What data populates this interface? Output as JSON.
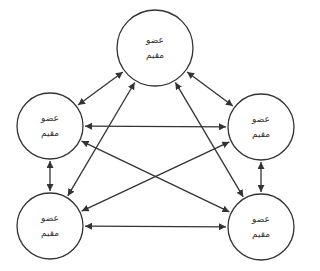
{
  "diagram": {
    "type": "fully-connected network",
    "stroke_color": "#333333",
    "background": "#ffffff",
    "nodes": [
      {
        "id": "top",
        "cx": 155,
        "cy": 48,
        "r": 38,
        "line1": "عضو",
        "line2": "مقيم"
      },
      {
        "id": "left-mid",
        "cx": 50,
        "cy": 126,
        "r": 33,
        "line1": "عضو",
        "line2": "مقيم"
      },
      {
        "id": "right-mid",
        "cx": 261,
        "cy": 127,
        "r": 33,
        "line1": "عضو",
        "line2": "مقيم"
      },
      {
        "id": "left-bottom",
        "cx": 50,
        "cy": 226,
        "r": 33,
        "line1": "عضو",
        "line2": "مقيم"
      },
      {
        "id": "right-bottom",
        "cx": 261,
        "cy": 227,
        "r": 33,
        "line1": "عضو",
        "line2": "مقيم"
      }
    ],
    "edges": [
      {
        "from": "top",
        "to": "left-mid",
        "bidirectional": true
      },
      {
        "from": "top",
        "to": "right-mid",
        "bidirectional": true
      },
      {
        "from": "left-mid",
        "to": "right-mid",
        "bidirectional": true
      },
      {
        "from": "left-mid",
        "to": "left-bottom",
        "bidirectional": true
      },
      {
        "from": "right-mid",
        "to": "right-bottom",
        "bidirectional": true
      },
      {
        "from": "left-bottom",
        "to": "right-bottom",
        "bidirectional": true
      },
      {
        "from": "top",
        "to": "left-bottom",
        "bidirectional": true
      },
      {
        "from": "top",
        "to": "right-bottom",
        "bidirectional": true
      },
      {
        "from": "left-mid",
        "to": "right-bottom",
        "bidirectional": true
      },
      {
        "from": "right-mid",
        "to": "left-bottom",
        "bidirectional": true
      }
    ]
  }
}
